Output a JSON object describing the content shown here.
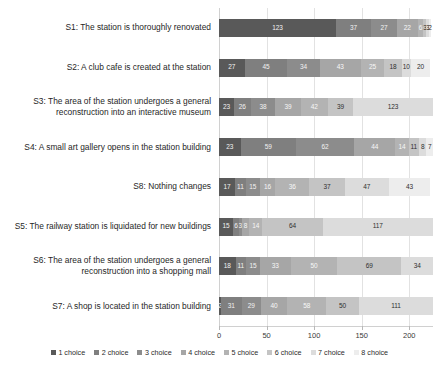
{
  "chart_data": {
    "type": "bar",
    "orientation": "horizontal",
    "stacked": true,
    "title": "",
    "xlabel": "",
    "ylabel": "",
    "xlim": [
      0,
      225
    ],
    "xticks": [
      0,
      50,
      100,
      150,
      200
    ],
    "xtick_labels": [
      "0",
      "50",
      "100",
      "150",
      "200"
    ],
    "grid": true,
    "legend_position": "bottom",
    "categories": [
      "S1: The station is thoroughly renovated",
      "S2: A club cafe is created at the station",
      "S3: The area of the station undergoes a general reconstruction into an interactive museum",
      "S4: A small art gallery opens in the station building",
      "S8: Nothing changes",
      "S5: The railway station is liquidated for new buildings",
      "S6: The area of the station undergoes a general reconstruction into a shopping mall",
      "S7: A shop is located in the station building"
    ],
    "series": [
      {
        "name": "1 choice",
        "color": "#595959",
        "values": [
          123,
          27,
          23,
          23,
          17,
          15,
          18,
          2
        ]
      },
      {
        "name": "2 choice",
        "color": "#7f7f7f",
        "values": [
          37,
          45,
          26,
          59,
          11,
          6,
          11,
          31
        ]
      },
      {
        "name": "3 choice",
        "color": "#8c8c8c",
        "values": [
          27,
          34,
          38,
          62,
          15,
          3,
          15,
          29
        ]
      },
      {
        "name": "4 choice",
        "color": "#a6a6a6",
        "values": [
          22,
          43,
          39,
          44,
          16,
          8,
          33,
          40
        ]
      },
      {
        "name": "5 choice",
        "color": "#b3b3b3",
        "values": [
          6,
          25,
          42,
          14,
          36,
          14,
          50,
          58
        ]
      },
      {
        "name": "6 choice",
        "color": "#c4c4c4",
        "values": [
          3,
          18,
          39,
          11,
          37,
          64,
          69,
          50
        ]
      },
      {
        "name": "7 choice",
        "color": "#dcdcdc",
        "values": [
          3,
          10,
          123,
          8,
          47,
          117,
          34,
          111
        ]
      },
      {
        "name": "8 choice",
        "color": "#ededed",
        "values": [
          2,
          20,
          0,
          7,
          43,
          0,
          0,
          0
        ]
      }
    ]
  },
  "legend": {
    "items": [
      {
        "label": "1 choice",
        "color": "#595959"
      },
      {
        "label": "2 choice",
        "color": "#7f7f7f"
      },
      {
        "label": "3 choice",
        "color": "#8c8c8c"
      },
      {
        "label": "4 choice",
        "color": "#a6a6a6"
      },
      {
        "label": "5 choice",
        "color": "#b3b3b3"
      },
      {
        "label": "6 choice",
        "color": "#c4c4c4"
      },
      {
        "label": "7 choice",
        "color": "#dcdcdc"
      },
      {
        "label": "8 choice",
        "color": "#ededed"
      }
    ]
  },
  "axis": {
    "ticks": [
      "0",
      "50",
      "100",
      "150",
      "200"
    ]
  },
  "category_labels": [
    {
      "lines": [
        "S1: The station is thoroughly renovated"
      ]
    },
    {
      "lines": [
        "S2: A club cafe is created at the station"
      ]
    },
    {
      "lines": [
        "S3: The area of the station undergoes a general",
        "reconstruction into an interactive museum"
      ]
    },
    {
      "lines": [
        "S4: A small art gallery opens in the station building"
      ]
    },
    {
      "lines": [
        "S8: Nothing changes"
      ]
    },
    {
      "lines": [
        "S5: The railway station is liquidated for new buildings"
      ]
    },
    {
      "lines": [
        "S6: The area of the station undergoes a general",
        "reconstruction into a shopping mall"
      ]
    },
    {
      "lines": [
        "S7: A shop is located in the station building"
      ]
    }
  ],
  "bar_labels": [
    [
      "123",
      "37",
      "27",
      "22",
      "6",
      "3",
      "3",
      "2"
    ],
    [
      "27",
      "45",
      "34",
      "43",
      "25",
      "18",
      "10",
      "20"
    ],
    [
      "23",
      "26",
      "38",
      "39",
      "42",
      "39",
      "123",
      ""
    ],
    [
      "23",
      "59",
      "62",
      "44",
      "14",
      "11",
      "8",
      "7"
    ],
    [
      "17",
      "11",
      "15",
      "16",
      "36",
      "37",
      "47",
      "43"
    ],
    [
      "15",
      "6",
      "3",
      "8",
      "14",
      "64",
      "117",
      ""
    ],
    [
      "18",
      "11",
      "15",
      "33",
      "50",
      "69",
      "34",
      ""
    ],
    [
      "2",
      "31",
      "29",
      "40",
      "58",
      "50",
      "111",
      ""
    ]
  ]
}
